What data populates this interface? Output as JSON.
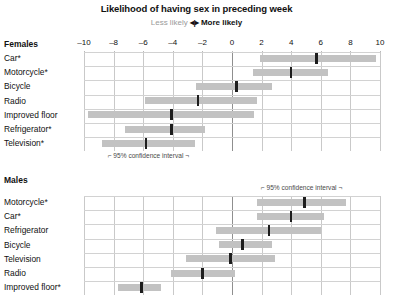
{
  "header": {
    "title": "Likelihood of having sex in preceding week",
    "subtitle_left": "Less likely",
    "subtitle_arrow": "◂|▸",
    "subtitle_right": "More likely"
  },
  "annotations": {
    "females_ci": "⌐ 95% confidence interval ¬",
    "males_ci": "⌐ 95% confidence interval ¬"
  },
  "chart_data": {
    "type": "bar",
    "title": "Likelihood of having sex in preceding week",
    "subtitle": "Less likely ◂|▸ More likely",
    "xlabel": "",
    "ylabel": "",
    "xlim": [
      -10,
      10
    ],
    "xticks": [
      -10,
      -8,
      -6,
      -4,
      -2,
      0,
      2,
      4,
      6,
      8,
      10
    ],
    "xticklabels": [
      "–10",
      "–8",
      "–6",
      "–4",
      "–2",
      "0",
      "2",
      "4",
      "6",
      "8",
      "10"
    ],
    "grid": true,
    "legend": "95% confidence interval",
    "colors": {
      "interval": "#c2c2c2",
      "median": "#1d1d1d",
      "grid": "#c9c9c9",
      "zero_line": "#8f8f8f"
    },
    "panels": [
      {
        "name": "Females",
        "categories": [
          {
            "label": "Car*",
            "median": 5.7,
            "low": 1.9,
            "high": 9.7
          },
          {
            "label": "Motorcycle*",
            "median": 4.0,
            "low": 1.4,
            "high": 6.5
          },
          {
            "label": "Bicycle",
            "median": 0.3,
            "low": -2.4,
            "high": 2.7
          },
          {
            "label": "Radio",
            "median": -2.3,
            "low": -5.9,
            "high": 1.7
          },
          {
            "label": "Improved floor",
            "median": -4.1,
            "low": -9.7,
            "high": 1.5
          },
          {
            "label": "Refrigerator*",
            "median": -4.1,
            "low": -7.2,
            "high": -1.8
          },
          {
            "label": "Television*",
            "median": -5.8,
            "low": -8.8,
            "high": -2.5
          }
        ]
      },
      {
        "name": "Males",
        "categories": [
          {
            "label": "Motorcycle*",
            "median": 4.9,
            "low": 1.7,
            "high": 7.7
          },
          {
            "label": "Car*",
            "median": 4.0,
            "low": 1.7,
            "high": 6.2
          },
          {
            "label": "Refrigerator",
            "median": 2.5,
            "low": -1.1,
            "high": 6.0
          },
          {
            "label": "Bicycle",
            "median": 0.7,
            "low": -0.9,
            "high": 2.7
          },
          {
            "label": "Television",
            "median": -0.1,
            "low": -3.1,
            "high": 2.9
          },
          {
            "label": "Radio",
            "median": -2.0,
            "low": -4.1,
            "high": 0.2
          },
          {
            "label": "Improved floor*",
            "median": -6.1,
            "low": -7.7,
            "high": -4.8
          }
        ]
      }
    ]
  },
  "layout": {
    "x0_px": 232,
    "px_per_unit": 14.8,
    "females_axis_y": 44,
    "females_first_row_y": 58,
    "males_heading_y": 180,
    "males_first_row_y": 202,
    "row_step": 14.2
  }
}
